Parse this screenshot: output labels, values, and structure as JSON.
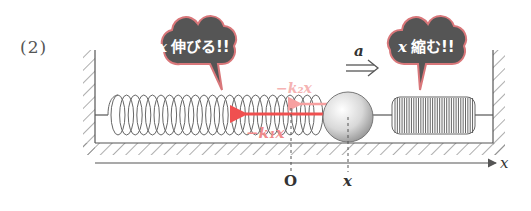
{
  "problem": {
    "number_label": "(2)"
  },
  "bubbles": [
    {
      "id": "stretch",
      "variable": "x",
      "text": "伸びる!!",
      "fill": "#555555",
      "border": "#d9777a"
    },
    {
      "id": "compress",
      "variable": "x",
      "text": "縮む!!",
      "fill": "#555555",
      "border": "#d9777a"
    }
  ],
  "acceleration": {
    "label": "a",
    "arrow": "⇒"
  },
  "forces": [
    {
      "id": "spring2-force",
      "label": "−k₂x",
      "color": "#f5b3b3"
    },
    {
      "id": "spring1-force",
      "label": "−k₁x",
      "color": "#f06060"
    }
  ],
  "axis": {
    "label": "x",
    "origin_label": "O",
    "position_label": "x"
  },
  "colors": {
    "line": "#555555",
    "force_arrow": "#f05050",
    "force_arrow_faint": "#f7a0a0"
  }
}
